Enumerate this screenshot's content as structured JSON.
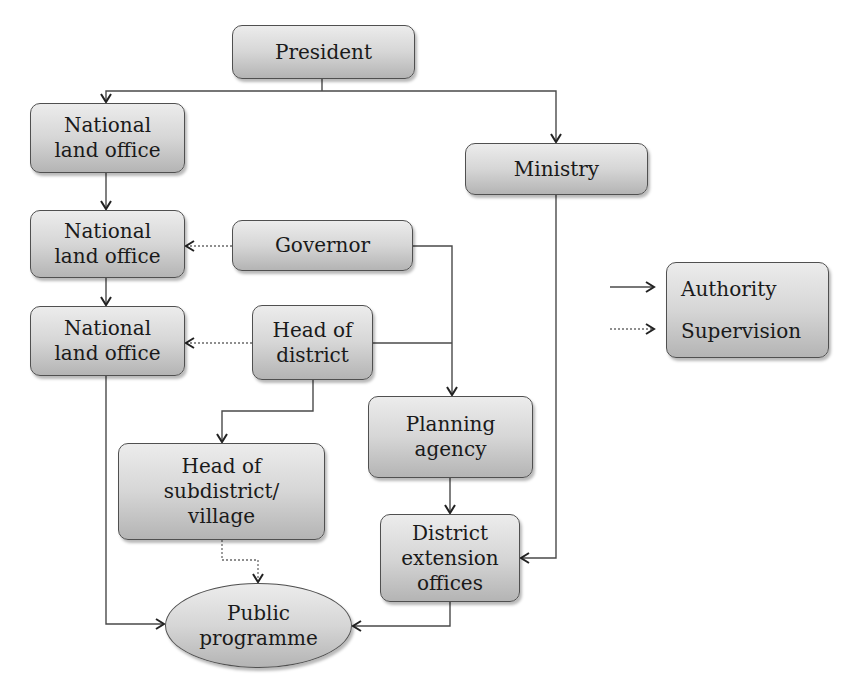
{
  "diagram": {
    "nodes": {
      "president": {
        "lines": [
          "President"
        ]
      },
      "ministry": {
        "lines": [
          "Ministry"
        ]
      },
      "national_land_office_1": {
        "lines": [
          "National",
          "land office"
        ]
      },
      "national_land_office_2": {
        "lines": [
          "National",
          "land office"
        ]
      },
      "national_land_office_3": {
        "lines": [
          "National",
          "land office"
        ]
      },
      "governor": {
        "lines": [
          "Governor"
        ]
      },
      "head_of_district": {
        "lines": [
          "Head of",
          "district"
        ]
      },
      "planning_agency": {
        "lines": [
          "Planning",
          "agency"
        ]
      },
      "head_of_subdistrict": {
        "lines": [
          "Head of",
          "subdistrict/",
          "village"
        ]
      },
      "district_extension_offices": {
        "lines": [
          "District",
          "extension",
          "offices"
        ]
      },
      "public_programme": {
        "lines": [
          "Public",
          "programme"
        ]
      }
    },
    "edges": [
      {
        "from": "President",
        "to": "National land office (1)",
        "type": "authority"
      },
      {
        "from": "President",
        "to": "Ministry",
        "type": "authority"
      },
      {
        "from": "National land office (1)",
        "to": "National land office (2)",
        "type": "authority"
      },
      {
        "from": "National land office (2)",
        "to": "National land office (3)",
        "type": "authority"
      },
      {
        "from": "Governor",
        "to": "National land office (2)",
        "type": "supervision"
      },
      {
        "from": "Head of district",
        "to": "National land office (3)",
        "type": "supervision"
      },
      {
        "from": "Governor",
        "to": "Planning agency",
        "type": "authority"
      },
      {
        "from": "Head of district",
        "to": "Planning agency",
        "type": "authority"
      },
      {
        "from": "Head of district",
        "to": "Head of subdistrict/village",
        "type": "authority"
      },
      {
        "from": "Planning agency",
        "to": "District extension offices",
        "type": "authority"
      },
      {
        "from": "Ministry",
        "to": "District extension offices",
        "type": "authority"
      },
      {
        "from": "National land office (3)",
        "to": "Public programme",
        "type": "authority"
      },
      {
        "from": "Head of subdistrict/village",
        "to": "Public programme",
        "type": "supervision"
      },
      {
        "from": "District extension offices",
        "to": "Public programme",
        "type": "authority"
      }
    ],
    "legend": {
      "authority": "Authority",
      "supervision": "Supervision"
    },
    "colors": {
      "line": "#4a4a4a",
      "border": "#505050",
      "fill_top": "#ececec",
      "fill_bottom": "#b4b4b4"
    }
  }
}
